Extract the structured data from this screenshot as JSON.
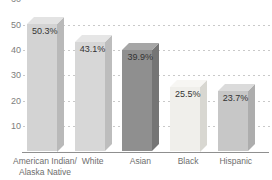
{
  "chart_data": {
    "type": "bar",
    "style": "3d-column",
    "title": "",
    "xlabel": "",
    "ylabel": "",
    "categories": [
      "American Indian/\nAlaska Native",
      "White",
      "Asian",
      "Black",
      "Hispanic"
    ],
    "values": [
      50.3,
      43.1,
      39.9,
      25.5,
      23.7
    ],
    "data_labels": [
      "50.3%",
      "43.1%",
      "39.9%",
      "25.5%",
      "23.7%"
    ],
    "y_ticks": [
      10,
      20,
      30,
      40,
      50,
      60
    ],
    "ylim": [
      0,
      60
    ],
    "grid": "horizontal-dashed",
    "legend": "none",
    "colors": {
      "background": "#ffffff",
      "gridline": "#c9c9c9",
      "axis_line": "#8f8f8f",
      "y_tick_text": "#7d7d7d",
      "category_text": "#6e6e6e",
      "value_label_text": "#333333",
      "bars": [
        {
          "front": "#d3d3d3",
          "top": "#e3e3e3",
          "side": "#b9b9b9"
        },
        {
          "front": "#d7d7d7",
          "top": "#e6e6e6",
          "side": "#bdbdbd"
        },
        {
          "front": "#8f8f8f",
          "top": "#a6a6a6",
          "side": "#757575"
        },
        {
          "front": "#f0efeb",
          "top": "#f7f6f3",
          "side": "#d8d7d1"
        },
        {
          "front": "#c7c7c7",
          "top": "#dbdbdb",
          "side": "#adadad"
        }
      ]
    }
  }
}
